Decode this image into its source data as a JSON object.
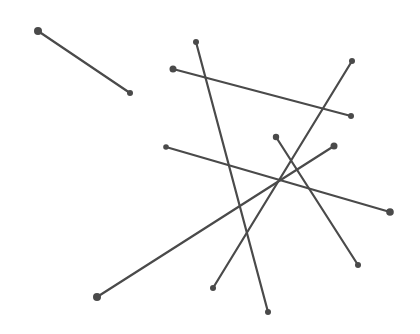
{
  "canvas": {
    "width": 420,
    "height": 334,
    "background": "#ffffff",
    "stroke_color": "#4a4a4a"
  },
  "segments": [
    {
      "id": "seg-1",
      "x1": 38,
      "y1": 31,
      "x2": 130,
      "y2": 93,
      "r1": 4.0,
      "r2": 3.0
    },
    {
      "id": "seg-2",
      "x1": 196,
      "y1": 42,
      "x2": 268,
      "y2": 312,
      "r1": 3.0,
      "r2": 3.0
    },
    {
      "id": "seg-3",
      "x1": 173,
      "y1": 69,
      "x2": 351,
      "y2": 116,
      "r1": 3.5,
      "r2": 3.0
    },
    {
      "id": "seg-4",
      "x1": 352,
      "y1": 61,
      "x2": 213,
      "y2": 288,
      "r1": 3.0,
      "r2": 3.0
    },
    {
      "id": "seg-5",
      "x1": 166,
      "y1": 147,
      "x2": 390,
      "y2": 212,
      "r1": 2.8,
      "r2": 3.8
    },
    {
      "id": "seg-6",
      "x1": 276,
      "y1": 137,
      "x2": 358,
      "y2": 265,
      "r1": 3.2,
      "r2": 3.0
    },
    {
      "id": "seg-7",
      "x1": 334,
      "y1": 146,
      "x2": 97,
      "y2": 297,
      "r1": 3.5,
      "r2": 4.0
    }
  ]
}
